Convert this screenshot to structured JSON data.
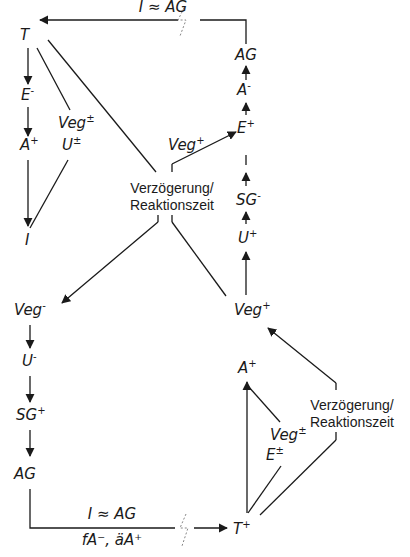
{
  "diagram": {
    "top_cycle_label": "I ≈ AG",
    "bottom_cycle_label_top": "I ≈ AG",
    "bottom_cycle_label_bottom": "fA⁻, äA⁺",
    "delay_label_line1": "Verzögerung/",
    "delay_label_line2": "Reaktionszeit",
    "left_top_chain": [
      {
        "base": "T",
        "sup": ""
      },
      {
        "base": "E",
        "sup": "-"
      },
      {
        "base": "A",
        "sup": "+"
      },
      {
        "base": "I",
        "sup": ""
      }
    ],
    "left_top_side": [
      {
        "base": "Veg",
        "sup": "±"
      },
      {
        "base": "U",
        "sup": "±"
      }
    ],
    "right_top_chain": [
      {
        "base": "AG",
        "sup": ""
      },
      {
        "base": "A",
        "sup": "-"
      },
      {
        "base": "E",
        "sup": "+"
      },
      {
        "base": "I",
        "sup": ""
      },
      {
        "base": "SG",
        "sup": "-"
      },
      {
        "base": "U",
        "sup": "+"
      },
      {
        "base": "Veg",
        "sup": "+"
      }
    ],
    "center_veg": {
      "base": "Veg",
      "sup": "+"
    },
    "left_bottom_chain": [
      {
        "base": "Veg",
        "sup": "-"
      },
      {
        "base": "U",
        "sup": "-"
      },
      {
        "base": "SG",
        "sup": "+"
      },
      {
        "base": "AG",
        "sup": ""
      }
    ],
    "right_bottom_chain": [
      {
        "base": "A",
        "sup": "+"
      },
      {
        "base": "T",
        "sup": "+"
      }
    ],
    "right_bottom_side": [
      {
        "base": "Veg",
        "sup": "±"
      },
      {
        "base": "E",
        "sup": "±"
      }
    ]
  }
}
